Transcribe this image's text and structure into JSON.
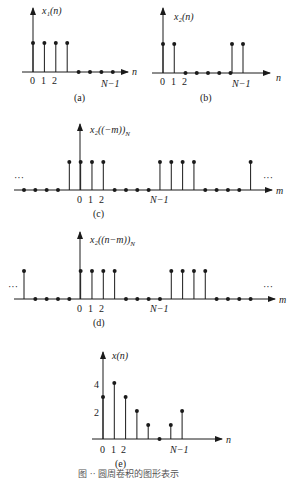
{
  "figure": {
    "caption": "图 ·· 圆周卷积的图形表示",
    "panels": [
      {
        "id": "a",
        "label": "(a)",
        "ylabel": "x₁(n)",
        "xlabel": "n",
        "ticks": [
          "0",
          "1",
          "2",
          "N−1"
        ],
        "values": [
          1,
          1,
          1,
          1,
          0,
          0,
          0,
          0
        ]
      },
      {
        "id": "b",
        "label": "(b)",
        "ylabel": "x₂(n)",
        "xlabel": "n",
        "ticks": [
          "0",
          "1",
          "2",
          "N−1"
        ],
        "values": [
          1,
          1,
          0,
          0,
          0,
          0,
          0,
          1,
          1
        ]
      },
      {
        "id": "c",
        "label": "(c)",
        "ylabel": "x₂((−m))",
        "ysub": "N",
        "xlabel": "m",
        "ticks": [
          "0",
          "1",
          "2",
          "N−1"
        ],
        "ellipsis": "···",
        "values": [
          0,
          0,
          0,
          0,
          1,
          1,
          1,
          1,
          0,
          0,
          0,
          0,
          1,
          1,
          1,
          1,
          0,
          0,
          0,
          0,
          1
        ]
      },
      {
        "id": "d",
        "label": "(d)",
        "ylabel": "x₂((n−m))",
        "ysub": "N",
        "xlabel": "m",
        "ticks": [
          "0",
          "1",
          "2",
          "N−1"
        ],
        "ellipsis": "···",
        "values": [
          1,
          0,
          0,
          0,
          0,
          1,
          1,
          1,
          1,
          0,
          0,
          0,
          0,
          1,
          1,
          1,
          1,
          0,
          0,
          0,
          0
        ]
      },
      {
        "id": "e",
        "label": "(e)",
        "ylabel": "x(n)",
        "xlabel": "n",
        "ticks": [
          "0",
          "1",
          "2",
          "N−1"
        ],
        "yticks": [
          "2",
          "4"
        ],
        "values": [
          3,
          4,
          3,
          2,
          1,
          0,
          1,
          2
        ]
      }
    ]
  }
}
